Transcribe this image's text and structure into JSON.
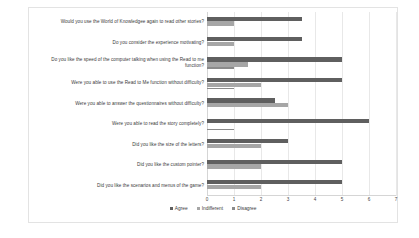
{
  "chart_data": {
    "type": "bar",
    "orientation": "horizontal",
    "title": "",
    "xlabel": "",
    "ylabel": "",
    "xlim": [
      0,
      7
    ],
    "xticks": [
      0,
      1,
      2,
      3,
      4,
      5,
      6,
      7
    ],
    "grid": true,
    "legend_position": "bottom",
    "categories": [
      "Would you use the World of Knowledgee again to read other stories?",
      "Do you consider the experience motivating?",
      "Do you like the speed of the computer talking when using the Read to me function?",
      "Were you able to use the Read to Me function without difficulty?",
      "Were you able to answer the questionnaires without difficulty?",
      "Were you able to read the story completely?",
      "Did you like the size of the letters?",
      "Did you like the custom pointer?",
      "Did you like the scenarios and menus of the game?"
    ],
    "series": [
      {
        "name": "Agree",
        "color": "#5f5f5f",
        "values": [
          3.5,
          3.5,
          5,
          5,
          2.5,
          6,
          3,
          5,
          5
        ]
      },
      {
        "name": "Indifferent",
        "color": "#a6a6a6",
        "values": [
          1,
          1,
          1.5,
          2,
          3,
          0,
          2,
          2,
          2
        ]
      },
      {
        "name": "Disagree",
        "color": "#8a8a8a",
        "values": [
          0,
          0,
          1,
          1,
          0,
          1,
          0,
          0,
          0
        ]
      }
    ]
  }
}
